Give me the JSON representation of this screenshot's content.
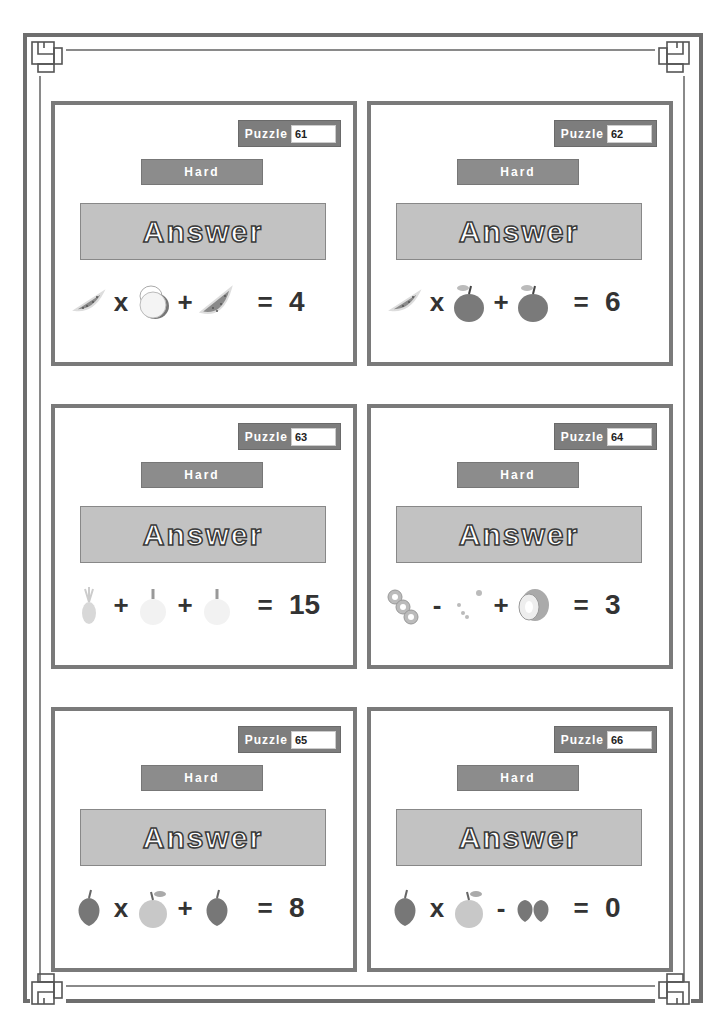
{
  "sheet": {
    "puzzle_label": "Puzzle",
    "answer_label": "Answer",
    "colors": {
      "frame": "#6e6e6e",
      "card_border": "#7a7a7a",
      "tag_bg": "#7d7d7d",
      "level_bg": "#8c8c8c",
      "answer_bg": "#c2c2c2"
    }
  },
  "cards": [
    {
      "number": "61",
      "level": "Hard",
      "terms": [
        "watermelon-slice",
        "coconut-halves",
        "watermelon-slice"
      ],
      "ops": [
        "x",
        "+"
      ],
      "equals": "=",
      "result": "4"
    },
    {
      "number": "62",
      "level": "Hard",
      "terms": [
        "watermelon-slice",
        "apple",
        "apple"
      ],
      "ops": [
        "x",
        "+"
      ],
      "equals": "=",
      "result": "6"
    },
    {
      "number": "63",
      "level": "Hard",
      "terms": [
        "pineapple",
        "pear",
        "pear"
      ],
      "ops": [
        "+",
        "+"
      ],
      "equals": "=",
      "result": "15"
    },
    {
      "number": "64",
      "level": "Hard",
      "terms": [
        "kiwi-slices",
        "seeds",
        "kiwi"
      ],
      "ops": [
        "-",
        "+"
      ],
      "equals": "=",
      "result": "3"
    },
    {
      "number": "65",
      "level": "Hard",
      "terms": [
        "strawberry",
        "orange",
        "strawberry"
      ],
      "ops": [
        "x",
        "+"
      ],
      "equals": "=",
      "result": "8"
    },
    {
      "number": "66",
      "level": "Hard",
      "terms": [
        "strawberry",
        "orange",
        "two-strawberries"
      ],
      "ops": [
        "x",
        "-"
      ],
      "equals": "=",
      "result": "0"
    }
  ]
}
